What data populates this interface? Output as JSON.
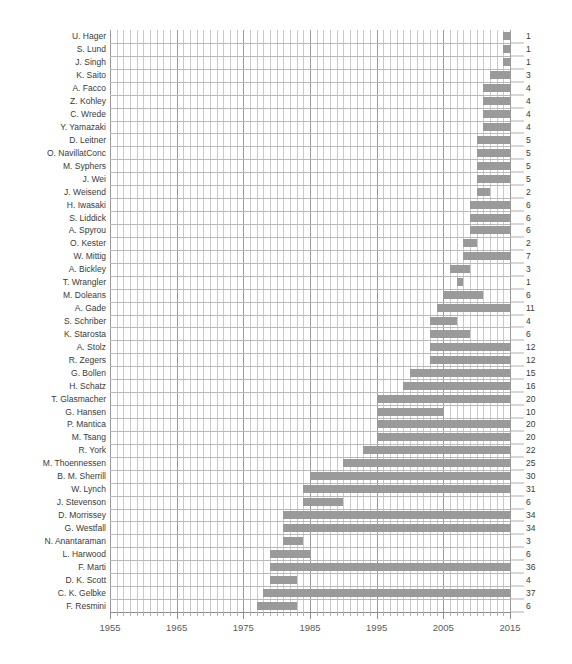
{
  "chart_data": {
    "type": "bar",
    "subtype": "gantt-timeline",
    "title": "",
    "xlabel": "",
    "ylabel": "",
    "xlim": [
      1955,
      2015
    ],
    "x_tick_step": 10,
    "x_minor_step": 1,
    "grid": true,
    "legend": null,
    "bar_color": "#9a9a9a",
    "x_ticks": [
      1955,
      1965,
      1975,
      1985,
      1995,
      2005,
      2015
    ],
    "x_tick_labels": [
      "1955",
      "1965",
      "1975",
      "1985",
      "1995",
      "2005",
      "2015"
    ],
    "value_column_header": "",
    "categories": [
      "U. Hager",
      "S. Lund",
      "J. Singh",
      "K. Saito",
      "A. Facco",
      "Z. Kohley",
      "C. Wrede",
      "Y. Yamazaki",
      "D. Leitner",
      "O. NavillatConc",
      "M. Syphers",
      "J. Wei",
      "J. Weisend",
      "H. Iwasaki",
      "S. Liddick",
      "A. Spyrou",
      "O. Kester",
      "W. Mittig",
      "A. Bickley",
      "T. Wrangler",
      "M. Doleans",
      "A. Gade",
      "S. Schriber",
      "K. Starosta",
      "A. Stolz",
      "R. Zegers",
      "G. Bollen",
      "H. Schatz",
      "T. Glasmacher",
      "G. Hansen",
      "P. Mantica",
      "M. Tsang",
      "R. York",
      "M. Thoennessen",
      "B. M. Sherrill",
      "W. Lynch",
      "J. Stevenson",
      "D. Morrissey",
      "G. Westfall",
      "N. Anantaraman",
      "L. Harwood",
      "F. Marti",
      "D. K. Scott",
      "C. K. Gelbke",
      "F. Resmini"
    ],
    "values": [
      1,
      1,
      1,
      3,
      4,
      4,
      4,
      4,
      5,
      5,
      5,
      5,
      2,
      6,
      6,
      6,
      2,
      7,
      3,
      1,
      6,
      11,
      4,
      6,
      12,
      12,
      15,
      16,
      20,
      10,
      20,
      20,
      22,
      25,
      30,
      31,
      6,
      34,
      34,
      3,
      6,
      36,
      4,
      37,
      6
    ],
    "bars": [
      {
        "label": "U. Hager",
        "start": 2014,
        "end": 2015,
        "value": 1
      },
      {
        "label": "S. Lund",
        "start": 2014,
        "end": 2015,
        "value": 1
      },
      {
        "label": "J. Singh",
        "start": 2014,
        "end": 2015,
        "value": 1
      },
      {
        "label": "K. Saito",
        "start": 2012,
        "end": 2015,
        "value": 3
      },
      {
        "label": "A. Facco",
        "start": 2011,
        "end": 2015,
        "value": 4
      },
      {
        "label": "Z. Kohley",
        "start": 2011,
        "end": 2015,
        "value": 4
      },
      {
        "label": "C. Wrede",
        "start": 2011,
        "end": 2015,
        "value": 4
      },
      {
        "label": "Y. Yamazaki",
        "start": 2011,
        "end": 2015,
        "value": 4
      },
      {
        "label": "D. Leitner",
        "start": 2010,
        "end": 2015,
        "value": 5
      },
      {
        "label": "O. NavillatConc",
        "start": 2010,
        "end": 2015,
        "value": 5
      },
      {
        "label": "M. Syphers",
        "start": 2010,
        "end": 2015,
        "value": 5
      },
      {
        "label": "J. Wei",
        "start": 2010,
        "end": 2015,
        "value": 5
      },
      {
        "label": "J. Weisend",
        "start": 2010,
        "end": 2012,
        "value": 2
      },
      {
        "label": "H. Iwasaki",
        "start": 2009,
        "end": 2015,
        "value": 6
      },
      {
        "label": "S. Liddick",
        "start": 2009,
        "end": 2015,
        "value": 6
      },
      {
        "label": "A. Spyrou",
        "start": 2009,
        "end": 2015,
        "value": 6
      },
      {
        "label": "O. Kester",
        "start": 2008,
        "end": 2010,
        "value": 2
      },
      {
        "label": "W. Mittig",
        "start": 2008,
        "end": 2015,
        "value": 7
      },
      {
        "label": "A. Bickley",
        "start": 2006,
        "end": 2009,
        "value": 3
      },
      {
        "label": "T. Wrangler",
        "start": 2007,
        "end": 2008,
        "value": 1
      },
      {
        "label": "M. Doleans",
        "start": 2005,
        "end": 2011,
        "value": 6
      },
      {
        "label": "A. Gade",
        "start": 2004,
        "end": 2015,
        "value": 11
      },
      {
        "label": "S. Schriber",
        "start": 2003,
        "end": 2007,
        "value": 4
      },
      {
        "label": "K. Starosta",
        "start": 2003,
        "end": 2009,
        "value": 6
      },
      {
        "label": "A. Stolz",
        "start": 2003,
        "end": 2015,
        "value": 12
      },
      {
        "label": "R. Zegers",
        "start": 2003,
        "end": 2015,
        "value": 12
      },
      {
        "label": "G. Bollen",
        "start": 2000,
        "end": 2015,
        "value": 15
      },
      {
        "label": "H. Schatz",
        "start": 1999,
        "end": 2015,
        "value": 16
      },
      {
        "label": "T. Glasmacher",
        "start": 1995,
        "end": 2015,
        "value": 20
      },
      {
        "label": "G. Hansen",
        "start": 1995,
        "end": 2005,
        "value": 10
      },
      {
        "label": "P. Mantica",
        "start": 1995,
        "end": 2015,
        "value": 20
      },
      {
        "label": "M. Tsang",
        "start": 1995,
        "end": 2015,
        "value": 20
      },
      {
        "label": "R. York",
        "start": 1993,
        "end": 2015,
        "value": 22
      },
      {
        "label": "M. Thoennessen",
        "start": 1990,
        "end": 2015,
        "value": 25
      },
      {
        "label": "B. M. Sherrill",
        "start": 1985,
        "end": 2015,
        "value": 30
      },
      {
        "label": "W. Lynch",
        "start": 1984,
        "end": 2015,
        "value": 31
      },
      {
        "label": "J. Stevenson",
        "start": 1984,
        "end": 1990,
        "value": 6
      },
      {
        "label": "D. Morrissey",
        "start": 1981,
        "end": 2015,
        "value": 34
      },
      {
        "label": "G. Westfall",
        "start": 1981,
        "end": 2015,
        "value": 34
      },
      {
        "label": "N. Anantaraman",
        "start": 1981,
        "end": 1984,
        "value": 3
      },
      {
        "label": "L. Harwood",
        "start": 1979,
        "end": 1985,
        "value": 6
      },
      {
        "label": "F. Marti",
        "start": 1979,
        "end": 2015,
        "value": 36
      },
      {
        "label": "D. K. Scott",
        "start": 1979,
        "end": 1983,
        "value": 4
      },
      {
        "label": "C. K. Gelbke",
        "start": 1978,
        "end": 2015,
        "value": 37
      },
      {
        "label": "F. Resmini",
        "start": 1977,
        "end": 1983,
        "value": 6
      }
    ]
  }
}
